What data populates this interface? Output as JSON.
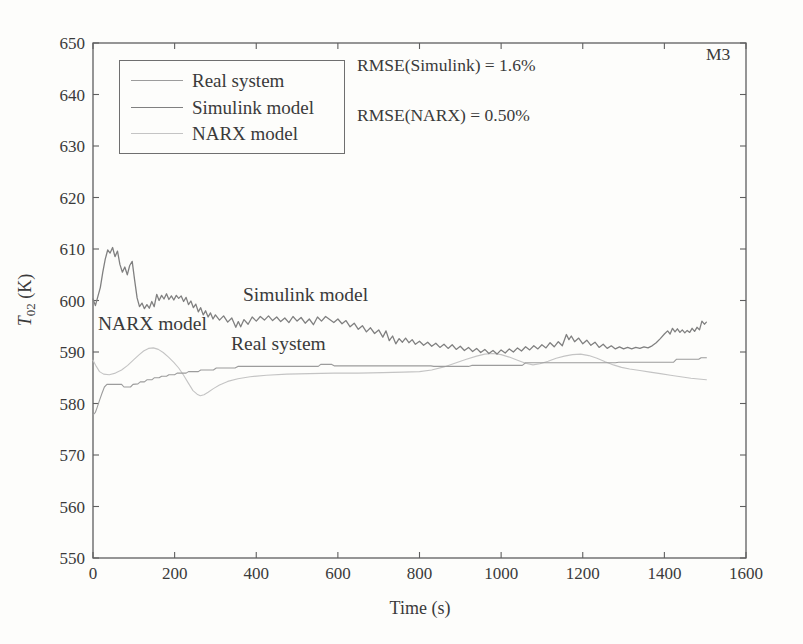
{
  "figure": {
    "id_label": "M3",
    "annotations": {
      "rmse_simulink": "RMSE(Simulink) = 1.6%",
      "rmse_narx": "RMSE(NARX) = 0.50%",
      "inplot_simulink": "Simulink model",
      "inplot_narx": "NARX model",
      "inplot_real": "Real system"
    },
    "colors": {
      "frame": "#5f5f5f",
      "text": "#3a3a3a",
      "background": "#fdfdfb"
    }
  },
  "chart_data": {
    "type": "line",
    "title": "",
    "xlabel": "Time (s)",
    "ylabel": "T02 (K)",
    "ylabel_parts": {
      "var": "T",
      "sub": "02",
      "unit": " (K)"
    },
    "xlim": [
      0,
      1600
    ],
    "ylim": [
      550,
      650
    ],
    "xticks": [
      0,
      200,
      400,
      600,
      800,
      1000,
      1200,
      1400,
      1600
    ],
    "yticks": [
      550,
      560,
      570,
      580,
      590,
      600,
      610,
      620,
      630,
      640,
      650
    ],
    "grid": false,
    "legend_position": "upper-left-inside",
    "series": [
      {
        "name": "Real system",
        "color": "#9c9c9c",
        "width": 1.1,
        "points": [
          [
            0,
            577.8
          ],
          [
            6,
            578.3
          ],
          [
            10,
            579.2
          ],
          [
            16,
            580.6
          ],
          [
            22,
            582.0
          ],
          [
            28,
            583.2
          ],
          [
            34,
            583.7
          ],
          [
            70,
            583.7
          ],
          [
            76,
            583.2
          ],
          [
            92,
            583.2
          ],
          [
            98,
            583.7
          ],
          [
            110,
            583.8
          ],
          [
            116,
            584.2
          ],
          [
            126,
            584.2
          ],
          [
            132,
            584.6
          ],
          [
            144,
            584.6
          ],
          [
            150,
            585.0
          ],
          [
            162,
            585.0
          ],
          [
            168,
            585.3
          ],
          [
            180,
            585.3
          ],
          [
            186,
            585.6
          ],
          [
            200,
            585.6
          ],
          [
            206,
            585.9
          ],
          [
            228,
            585.9
          ],
          [
            234,
            586.2
          ],
          [
            258,
            586.2
          ],
          [
            264,
            586.5
          ],
          [
            295,
            586.5
          ],
          [
            302,
            586.9
          ],
          [
            348,
            586.9
          ],
          [
            355,
            587.2
          ],
          [
            552,
            587.2
          ],
          [
            558,
            587.6
          ],
          [
            585,
            587.6
          ],
          [
            592,
            587.3
          ],
          [
            828,
            587.3
          ],
          [
            835,
            587.2
          ],
          [
            920,
            587.2
          ],
          [
            928,
            587.4
          ],
          [
            1052,
            587.4
          ],
          [
            1060,
            587.9
          ],
          [
            1280,
            587.9
          ],
          [
            1288,
            588.0
          ],
          [
            1422,
            588.0
          ],
          [
            1430,
            588.6
          ],
          [
            1484,
            588.6
          ],
          [
            1490,
            588.9
          ],
          [
            1503,
            588.9
          ]
        ]
      },
      {
        "name": "Simulink model",
        "color": "#808080",
        "width": 1.3,
        "points": [
          [
            0,
            600.3
          ],
          [
            6,
            599.0
          ],
          [
            12,
            600.8
          ],
          [
            18,
            602.5
          ],
          [
            24,
            605.5
          ],
          [
            30,
            608.0
          ],
          [
            36,
            609.8
          ],
          [
            42,
            609.2
          ],
          [
            48,
            610.3
          ],
          [
            54,
            608.5
          ],
          [
            60,
            609.6
          ],
          [
            66,
            607.0
          ],
          [
            72,
            605.5
          ],
          [
            78,
            606.5
          ],
          [
            84,
            605.0
          ],
          [
            90,
            606.8
          ],
          [
            96,
            607.6
          ],
          [
            102,
            604.0
          ],
          [
            108,
            600.5
          ],
          [
            114,
            598.8
          ],
          [
            120,
            599.5
          ],
          [
            126,
            598.4
          ],
          [
            132,
            599.2
          ],
          [
            138,
            598.5
          ],
          [
            144,
            599.8
          ],
          [
            150,
            598.8
          ],
          [
            156,
            601.2
          ],
          [
            162,
            600.0
          ],
          [
            168,
            601.0
          ],
          [
            174,
            600.3
          ],
          [
            180,
            601.3
          ],
          [
            186,
            600.2
          ],
          [
            192,
            600.9
          ],
          [
            198,
            600.1
          ],
          [
            204,
            601.0
          ],
          [
            210,
            600.4
          ],
          [
            216,
            600.9
          ],
          [
            222,
            599.8
          ],
          [
            228,
            600.6
          ],
          [
            234,
            599.2
          ],
          [
            240,
            599.9
          ],
          [
            246,
            598.6
          ],
          [
            252,
            599.3
          ],
          [
            258,
            597.8
          ],
          [
            264,
            598.6
          ],
          [
            270,
            597.2
          ],
          [
            276,
            598.0
          ],
          [
            282,
            596.8
          ],
          [
            288,
            597.6
          ],
          [
            294,
            596.4
          ],
          [
            300,
            597.2
          ],
          [
            310,
            596.2
          ],
          [
            320,
            597.0
          ],
          [
            330,
            595.8
          ],
          [
            340,
            596.6
          ],
          [
            350,
            594.8
          ],
          [
            356,
            595.9
          ],
          [
            362,
            594.9
          ],
          [
            370,
            596.3
          ],
          [
            380,
            595.4
          ],
          [
            390,
            596.8
          ],
          [
            400,
            596.0
          ],
          [
            410,
            596.9
          ],
          [
            420,
            596.2
          ],
          [
            430,
            597.0
          ],
          [
            440,
            596.1
          ],
          [
            450,
            596.8
          ],
          [
            460,
            595.9
          ],
          [
            470,
            596.6
          ],
          [
            480,
            595.7
          ],
          [
            490,
            596.9
          ],
          [
            500,
            596.0
          ],
          [
            510,
            596.7
          ],
          [
            520,
            595.6
          ],
          [
            530,
            596.4
          ],
          [
            540,
            595.3
          ],
          [
            550,
            596.8
          ],
          [
            560,
            596.0
          ],
          [
            570,
            596.9
          ],
          [
            580,
            596.3
          ],
          [
            590,
            595.7
          ],
          [
            600,
            596.4
          ],
          [
            610,
            595.5
          ],
          [
            620,
            596.1
          ],
          [
            630,
            594.9
          ],
          [
            640,
            595.6
          ],
          [
            650,
            594.4
          ],
          [
            660,
            595.1
          ],
          [
            670,
            593.9
          ],
          [
            680,
            594.7
          ],
          [
            690,
            593.6
          ],
          [
            700,
            594.3
          ],
          [
            710,
            592.9
          ],
          [
            718,
            594.1
          ],
          [
            726,
            592.2
          ],
          [
            734,
            593.1
          ],
          [
            742,
            591.6
          ],
          [
            750,
            592.6
          ],
          [
            758,
            591.9
          ],
          [
            766,
            592.7
          ],
          [
            774,
            591.8
          ],
          [
            782,
            592.4
          ],
          [
            790,
            591.5
          ],
          [
            800,
            592.1
          ],
          [
            810,
            591.3
          ],
          [
            820,
            591.9
          ],
          [
            830,
            591.1
          ],
          [
            840,
            591.7
          ],
          [
            850,
            590.9
          ],
          [
            860,
            591.5
          ],
          [
            870,
            590.7
          ],
          [
            880,
            591.4
          ],
          [
            890,
            590.5
          ],
          [
            900,
            591.1
          ],
          [
            910,
            590.3
          ],
          [
            920,
            590.9
          ],
          [
            930,
            590.1
          ],
          [
            940,
            590.7
          ],
          [
            950,
            589.9
          ],
          [
            960,
            590.5
          ],
          [
            970,
            589.7
          ],
          [
            980,
            590.3
          ],
          [
            990,
            589.6
          ],
          [
            1000,
            590.4
          ],
          [
            1010,
            589.8
          ],
          [
            1020,
            590.6
          ],
          [
            1030,
            590.0
          ],
          [
            1040,
            590.8
          ],
          [
            1050,
            590.2
          ],
          [
            1060,
            591.0
          ],
          [
            1070,
            590.4
          ],
          [
            1080,
            591.2
          ],
          [
            1090,
            590.6
          ],
          [
            1100,
            591.4
          ],
          [
            1110,
            590.8
          ],
          [
            1120,
            591.8
          ],
          [
            1130,
            591.0
          ],
          [
            1140,
            592.0
          ],
          [
            1150,
            591.2
          ],
          [
            1160,
            593.4
          ],
          [
            1166,
            592.4
          ],
          [
            1172,
            593.1
          ],
          [
            1180,
            592.0
          ],
          [
            1190,
            592.7
          ],
          [
            1200,
            591.6
          ],
          [
            1210,
            592.3
          ],
          [
            1220,
            591.3
          ],
          [
            1230,
            591.9
          ],
          [
            1240,
            590.9
          ],
          [
            1250,
            591.5
          ],
          [
            1260,
            590.7
          ],
          [
            1270,
            591.2
          ],
          [
            1280,
            590.6
          ],
          [
            1290,
            591.0
          ],
          [
            1300,
            590.6
          ],
          [
            1310,
            590.9
          ],
          [
            1320,
            590.6
          ],
          [
            1330,
            590.9
          ],
          [
            1340,
            590.7
          ],
          [
            1350,
            591.0
          ],
          [
            1360,
            590.8
          ],
          [
            1370,
            591.2
          ],
          [
            1380,
            591.8
          ],
          [
            1390,
            592.6
          ],
          [
            1400,
            593.5
          ],
          [
            1408,
            594.1
          ],
          [
            1414,
            593.5
          ],
          [
            1420,
            594.6
          ],
          [
            1426,
            593.9
          ],
          [
            1432,
            594.5
          ],
          [
            1438,
            593.8
          ],
          [
            1444,
            594.3
          ],
          [
            1450,
            593.7
          ],
          [
            1456,
            594.2
          ],
          [
            1462,
            593.8
          ],
          [
            1468,
            594.6
          ],
          [
            1474,
            594.0
          ],
          [
            1480,
            594.8
          ],
          [
            1486,
            594.3
          ],
          [
            1492,
            596.0
          ],
          [
            1498,
            595.4
          ],
          [
            1503,
            595.8
          ]
        ]
      },
      {
        "name": "NARX model",
        "color": "#c4c4c4",
        "width": 1.1,
        "points": [
          [
            0,
            588.4
          ],
          [
            8,
            587.2
          ],
          [
            16,
            586.2
          ],
          [
            26,
            585.7
          ],
          [
            40,
            585.6
          ],
          [
            55,
            585.9
          ],
          [
            70,
            586.5
          ],
          [
            85,
            587.4
          ],
          [
            100,
            588.5
          ],
          [
            112,
            589.4
          ],
          [
            124,
            590.2
          ],
          [
            136,
            590.7
          ],
          [
            148,
            590.8
          ],
          [
            160,
            590.5
          ],
          [
            172,
            589.9
          ],
          [
            185,
            589.0
          ],
          [
            198,
            588.0
          ],
          [
            210,
            586.9
          ],
          [
            222,
            585.5
          ],
          [
            234,
            583.9
          ],
          [
            245,
            582.5
          ],
          [
            255,
            581.8
          ],
          [
            263,
            581.5
          ],
          [
            272,
            581.7
          ],
          [
            282,
            582.2
          ],
          [
            295,
            582.9
          ],
          [
            310,
            583.6
          ],
          [
            330,
            584.3
          ],
          [
            355,
            584.8
          ],
          [
            385,
            585.2
          ],
          [
            425,
            585.5
          ],
          [
            475,
            585.7
          ],
          [
            530,
            585.8
          ],
          [
            590,
            585.9
          ],
          [
            650,
            585.9
          ],
          [
            710,
            586.0
          ],
          [
            760,
            586.1
          ],
          [
            800,
            586.2
          ],
          [
            830,
            586.5
          ],
          [
            860,
            587.1
          ],
          [
            890,
            587.9
          ],
          [
            915,
            588.6
          ],
          [
            940,
            589.2
          ],
          [
            960,
            589.6
          ],
          [
            980,
            589.7
          ],
          [
            1000,
            589.5
          ],
          [
            1020,
            589.0
          ],
          [
            1040,
            588.4
          ],
          [
            1060,
            587.8
          ],
          [
            1078,
            587.5
          ],
          [
            1095,
            587.7
          ],
          [
            1115,
            588.2
          ],
          [
            1135,
            588.8
          ],
          [
            1155,
            589.2
          ],
          [
            1175,
            589.5
          ],
          [
            1195,
            589.6
          ],
          [
            1215,
            589.3
          ],
          [
            1235,
            588.8
          ],
          [
            1255,
            588.1
          ],
          [
            1275,
            587.5
          ],
          [
            1295,
            587.0
          ],
          [
            1315,
            586.7
          ],
          [
            1340,
            586.4
          ],
          [
            1365,
            586.1
          ],
          [
            1390,
            585.8
          ],
          [
            1415,
            585.5
          ],
          [
            1440,
            585.2
          ],
          [
            1465,
            584.9
          ],
          [
            1490,
            584.7
          ],
          [
            1503,
            584.6
          ]
        ]
      }
    ]
  }
}
